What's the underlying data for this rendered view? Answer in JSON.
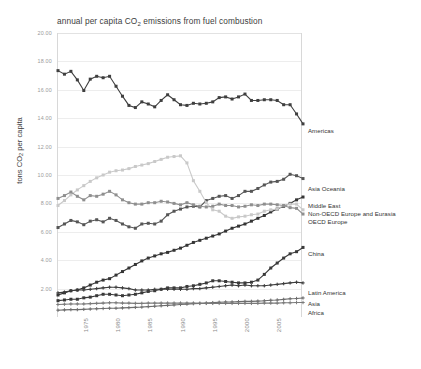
{
  "chart_data": {
    "type": "line",
    "title_plain": "annual per capita CO2 emissions from fuel combustion",
    "xlabel": "",
    "ylabel": "tons CO₂ per capita",
    "ylabel_plain": "tons CO2 per capita",
    "ylim": [
      0,
      20
    ],
    "xlim": [
      1971,
      2009
    ],
    "grid": true,
    "legend_position": "right-inline",
    "ytick_labels": [
      "20.00",
      "18.00",
      "16.00",
      "14.00",
      "12.00",
      "10.00",
      "8.00",
      "6.00",
      "4.00",
      "2.00"
    ],
    "ytick_values": [
      20,
      18,
      16,
      14,
      12,
      10,
      8,
      6,
      4,
      2
    ],
    "xtick_labels": [
      "1975",
      "1980",
      "1985",
      "1990",
      "1995",
      "2000",
      "2005"
    ],
    "xtick_values": [
      1975,
      1980,
      1985,
      1990,
      1995,
      2000,
      2005
    ],
    "x": [
      1971,
      1972,
      1973,
      1974,
      1975,
      1976,
      1977,
      1978,
      1979,
      1980,
      1981,
      1982,
      1983,
      1984,
      1985,
      1986,
      1987,
      1988,
      1989,
      1990,
      1991,
      1992,
      1993,
      1994,
      1995,
      1996,
      1997,
      1998,
      1999,
      2000,
      2001,
      2002,
      2003,
      2004,
      2005,
      2006,
      2007,
      2008,
      2009
    ],
    "series": [
      {
        "name": "Americas",
        "color": "#3f3f3f",
        "marker": "square",
        "values": [
          17.35,
          17.1,
          17.3,
          16.7,
          15.95,
          16.75,
          16.95,
          16.85,
          16.95,
          16.25,
          15.55,
          14.9,
          14.75,
          15.15,
          15.0,
          14.8,
          15.25,
          15.65,
          15.3,
          14.95,
          14.9,
          15.05,
          15.0,
          15.05,
          15.15,
          15.45,
          15.5,
          15.35,
          15.5,
          15.7,
          15.25,
          15.25,
          15.3,
          15.3,
          15.25,
          14.95,
          14.95,
          14.3,
          13.6
        ]
      },
      {
        "name": "Asia Oceania",
        "color": "#565656",
        "marker": "square",
        "values": [
          6.3,
          6.55,
          6.8,
          6.7,
          6.5,
          6.75,
          6.85,
          6.7,
          6.95,
          6.8,
          6.55,
          6.35,
          6.25,
          6.55,
          6.6,
          6.55,
          6.75,
          7.2,
          7.45,
          7.6,
          7.75,
          7.8,
          7.75,
          8.2,
          8.35,
          8.5,
          8.55,
          8.35,
          8.55,
          8.85,
          8.85,
          9.05,
          9.3,
          9.5,
          9.55,
          9.7,
          10.05,
          9.95,
          9.75
        ]
      },
      {
        "name": "Middle East",
        "color": "#353535",
        "marker": "square",
        "values": [
          1.55,
          1.7,
          1.85,
          1.9,
          2.05,
          2.25,
          2.45,
          2.6,
          2.7,
          2.95,
          3.2,
          3.45,
          3.7,
          3.95,
          4.15,
          4.3,
          4.45,
          4.55,
          4.7,
          4.85,
          5.05,
          5.25,
          5.4,
          5.55,
          5.7,
          5.85,
          6.05,
          6.25,
          6.4,
          6.55,
          6.75,
          6.95,
          7.15,
          7.4,
          7.6,
          7.8,
          8.0,
          8.25,
          8.45
        ]
      },
      {
        "name": "Non-OECD Europe and Eurasia",
        "color": "#c9c9c9",
        "marker": "square",
        "values": [
          7.85,
          8.2,
          8.6,
          8.95,
          9.25,
          9.55,
          9.8,
          10.0,
          10.2,
          10.3,
          10.35,
          10.45,
          10.6,
          10.7,
          10.8,
          10.95,
          11.1,
          11.25,
          11.3,
          11.35,
          10.85,
          9.6,
          8.85,
          8.05,
          7.55,
          7.45,
          7.1,
          6.95,
          7.05,
          7.1,
          7.2,
          7.25,
          7.45,
          7.55,
          7.6,
          7.85,
          7.95,
          7.95,
          7.55
        ]
      },
      {
        "name": "OECD Europe",
        "color": "#8f8f8f",
        "marker": "square",
        "values": [
          8.35,
          8.55,
          8.8,
          8.5,
          8.25,
          8.55,
          8.5,
          8.65,
          8.85,
          8.6,
          8.25,
          8.05,
          7.95,
          7.95,
          8.05,
          8.05,
          8.15,
          8.1,
          8.0,
          7.9,
          8.05,
          7.9,
          7.8,
          7.75,
          7.8,
          7.95,
          7.85,
          7.85,
          7.75,
          7.8,
          7.9,
          7.85,
          7.95,
          7.95,
          7.9,
          7.85,
          7.7,
          7.65,
          7.25
        ]
      },
      {
        "name": "China",
        "color": "#3a3a3a",
        "marker": "square",
        "values": [
          1.15,
          1.2,
          1.25,
          1.25,
          1.35,
          1.4,
          1.5,
          1.6,
          1.6,
          1.55,
          1.5,
          1.55,
          1.6,
          1.7,
          1.8,
          1.85,
          1.95,
          2.05,
          2.05,
          2.05,
          2.15,
          2.2,
          2.3,
          2.4,
          2.55,
          2.55,
          2.5,
          2.45,
          2.4,
          2.4,
          2.45,
          2.6,
          3.0,
          3.45,
          3.8,
          4.15,
          4.45,
          4.6,
          4.9
        ]
      },
      {
        "name": "Latin America",
        "color": "#3d3d3d",
        "marker": "plus",
        "values": [
          1.7,
          1.75,
          1.85,
          1.9,
          1.9,
          1.95,
          2.0,
          2.05,
          2.1,
          2.1,
          2.05,
          2.0,
          1.9,
          1.9,
          1.9,
          1.95,
          1.95,
          1.95,
          1.95,
          1.95,
          1.95,
          2.0,
          2.0,
          2.05,
          2.1,
          2.15,
          2.2,
          2.25,
          2.2,
          2.25,
          2.2,
          2.2,
          2.2,
          2.25,
          2.3,
          2.35,
          2.4,
          2.45,
          2.4
        ]
      },
      {
        "name": "Asia",
        "color": "#6d6d6d",
        "marker": "plus",
        "values": [
          0.48,
          0.5,
          0.52,
          0.52,
          0.54,
          0.56,
          0.58,
          0.6,
          0.62,
          0.62,
          0.64,
          0.66,
          0.68,
          0.7,
          0.73,
          0.76,
          0.79,
          0.82,
          0.85,
          0.88,
          0.91,
          0.94,
          0.96,
          0.98,
          1.01,
          1.04,
          1.06,
          1.06,
          1.08,
          1.1,
          1.1,
          1.12,
          1.14,
          1.18,
          1.2,
          1.24,
          1.28,
          1.3,
          1.34
        ]
      },
      {
        "name": "Africa",
        "color": "#7a7a7a",
        "marker": "plus",
        "values": [
          0.88,
          0.9,
          0.92,
          0.92,
          0.92,
          0.94,
          0.96,
          0.98,
          1.0,
          1.0,
          0.98,
          0.98,
          0.96,
          0.96,
          0.98,
          0.98,
          0.98,
          0.98,
          0.98,
          0.98,
          0.98,
          0.98,
          0.96,
          0.96,
          0.96,
          0.96,
          0.96,
          0.96,
          0.96,
          0.96,
          0.96,
          0.96,
          0.98,
          0.98,
          0.98,
          1.0,
          1.0,
          1.02,
          1.02
        ]
      }
    ],
    "legend_entries": [
      {
        "label": "Americas",
        "y": 131
      },
      {
        "label": "Asia Oceania",
        "y": 189
      },
      {
        "label": "Middle East",
        "y": 206
      },
      {
        "label": "Non-OECD Europe and Eurasia",
        "y": 214
      },
      {
        "label": "OECD Europe",
        "y": 222
      },
      {
        "label": "China",
        "y": 254
      },
      {
        "label": "Latin America",
        "y": 293
      },
      {
        "label": "Asia",
        "y": 304
      },
      {
        "label": "Africa",
        "y": 313
      }
    ]
  }
}
